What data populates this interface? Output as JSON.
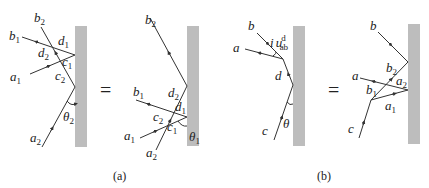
{
  "panels": {
    "a": {
      "caption": "(a)",
      "equals": "=",
      "left": {
        "labels": {
          "b2": "b",
          "b2_sub": "2",
          "b1": "b",
          "b1_sub": "1",
          "d1": "d",
          "d1_sub": "1",
          "d2": "d",
          "d2_sub": "2",
          "c1": "c",
          "c1_sub": "1",
          "a1": "a",
          "a1_sub": "1",
          "c2": "c",
          "c2_sub": "2",
          "theta2": "θ",
          "theta2_sub": "2",
          "a2": "a",
          "a2_sub": "2"
        }
      },
      "right": {
        "labels": {
          "b2": "b",
          "b2_sub": "2",
          "b1": "b",
          "b1_sub": "1",
          "d2": "d",
          "d2_sub": "2",
          "d1": "d",
          "d1_sub": "1",
          "c2": "c",
          "c2_sub": "2",
          "c1": "c",
          "c1_sub": "1",
          "a1": "a",
          "a1_sub": "1",
          "a2": "a",
          "a2_sub": "2",
          "theta1": "θ",
          "theta1_sub": "1"
        }
      }
    },
    "b": {
      "caption": "(b)",
      "equals": "=",
      "left": {
        "labels": {
          "b": "b",
          "a": "a",
          "i": "i",
          "u": "u",
          "u_sup": "d",
          "u_sub": "ab",
          "d": "d",
          "c": "c",
          "theta": "θ"
        }
      },
      "right": {
        "labels": {
          "b": "b",
          "a": "a",
          "b2": "b",
          "b2_sub": "2",
          "a2": "a",
          "a2_sub": "2",
          "b1": "b",
          "b1_sub": "1",
          "a1": "a",
          "a1_sub": "1",
          "c": "c"
        }
      }
    }
  },
  "colors": {
    "wall": "#bdbdbd",
    "ray": "#333333",
    "text": "#222222"
  }
}
